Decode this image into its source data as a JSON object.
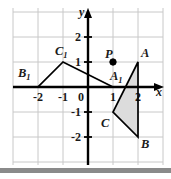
{
  "figure": {
    "type": "coordinate-plane-geometry",
    "background_color": "#ffffff",
    "grid_color": "#c8c8c8",
    "axis_color": "#000000",
    "shape_stroke_color": "#000000",
    "shaded_fill_color": "#dcdcdc",
    "grid": {
      "x_min": -3,
      "x_max": 3,
      "y_min": -3,
      "y_max": 3,
      "unit_px": 25,
      "origin_px": {
        "x": 88,
        "y": 87
      },
      "left_px": 13,
      "right_px": 163,
      "top_px": 8,
      "bottom_px": 165,
      "show_grid": true
    },
    "axes": {
      "x": {
        "name": "x",
        "label_px": {
          "x": 156,
          "y": 96
        },
        "arrow": "right"
      },
      "y": {
        "name": "y",
        "label_px": {
          "x": 79,
          "y": 16
        },
        "arrow": "up"
      }
    },
    "tick_labels": {
      "x": [
        {
          "text": "-2",
          "value": -2
        },
        {
          "text": "-1",
          "value": -1
        },
        {
          "text": "1",
          "value": 1
        },
        {
          "text": "2",
          "value": 2
        }
      ],
      "y": [
        {
          "text": "2",
          "value": 2
        },
        {
          "text": "1",
          "value": 1
        },
        {
          "text": "-1",
          "value": -1
        },
        {
          "text": "-2",
          "value": -2
        }
      ],
      "origin": {
        "text": "0",
        "value": 0
      }
    },
    "shapes": [
      {
        "name": "triangle-ABC",
        "shaded": true,
        "vertices": [
          {
            "label": "A",
            "subscript": "",
            "x": 2,
            "y": 1
          },
          {
            "label": "B",
            "subscript": "",
            "x": 2,
            "y": -2
          },
          {
            "label": "C",
            "subscript": "",
            "x": 1,
            "y": -1
          }
        ]
      },
      {
        "name": "triangle-A1B1C1",
        "shaded": false,
        "vertices": [
          {
            "label": "A",
            "subscript": "1",
            "x": 1,
            "y": 0
          },
          {
            "label": "B",
            "subscript": "1",
            "x": -2,
            "y": 0
          },
          {
            "label": "C",
            "subscript": "1",
            "x": -1,
            "y": 1
          }
        ]
      }
    ],
    "points": [
      {
        "label": "P",
        "x": 1,
        "y": 1,
        "filled": true,
        "radius_px": 3.2
      }
    ],
    "vertex_label_positions_px": {
      "A": {
        "x": 141,
        "y": 57
      },
      "B": {
        "x": 141,
        "y": 148
      },
      "C": {
        "x": 101,
        "y": 127
      },
      "A1": {
        "x": 110,
        "y": 80
      },
      "B1": {
        "x": 18,
        "y": 77
      },
      "C1": {
        "x": 55,
        "y": 55
      },
      "P": {
        "x": 105,
        "y": 58
      }
    }
  }
}
